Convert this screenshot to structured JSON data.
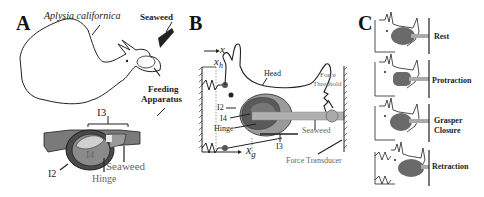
{
  "figure": {
    "panels": [
      {
        "id": "A",
        "letter": "A",
        "labels": {
          "species": "Aplysia californica",
          "seaweed_top": "Seaweed",
          "feeding_line1": "Feeding",
          "feeding_line2": "Apparatus",
          "i3": "I3",
          "i4": "I4",
          "i2": "I2",
          "seaweed_bottom": "Seaweed",
          "hinge": "Hinge"
        }
      },
      {
        "id": "B",
        "letter": "B",
        "labels": {
          "x": "x",
          "xh_base": "x",
          "xh_sub": "h",
          "head": "Head",
          "force_threshold_line1": "Force",
          "force_threshold_line2": "Threshold",
          "i2": "I2",
          "i4": "I4",
          "hinge": "Hinge",
          "seaweed": "Seaweed",
          "i3": "I3",
          "xg_base": "x",
          "xg_sub": "g",
          "force_transducer": "Force Transducer"
        }
      },
      {
        "id": "C",
        "letter": "C",
        "phases": [
          {
            "label": "Rest"
          },
          {
            "label": "Protraction"
          },
          {
            "label_line1": "Grasper",
            "label_line2": "Closure"
          },
          {
            "label": "Retraction"
          }
        ]
      }
    ],
    "colors": {
      "outline": "#222222",
      "grasper_dark": "#5a5a5a",
      "grasper_mid": "#8a8a8a",
      "grasper_light": "#b5b5b5",
      "seaweed": "#a0a0a0",
      "seaweed_dark": "#333333"
    }
  }
}
